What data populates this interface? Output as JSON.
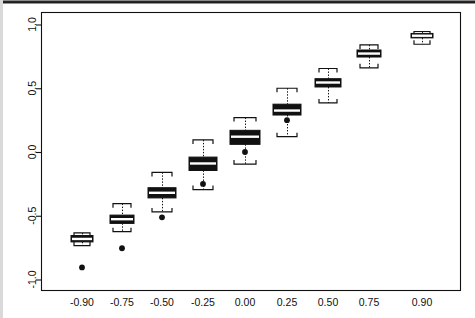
{
  "figure": {
    "kind": "boxplot-figure",
    "title": "",
    "background": "#ffffff",
    "ink_color": "#111111",
    "box_fill": "#111111",
    "median_color": "#ffffff"
  },
  "axes": {
    "x": {
      "label": "",
      "tick_labels": [
        "-0.90",
        "-0.75",
        "-0.50",
        "-0.25",
        "0.00",
        "0.25",
        "0.50",
        "0.75",
        "0.90"
      ]
    },
    "y": {
      "label": "",
      "tick_labels": [
        "-1.0",
        "-0.5",
        "0.0",
        "0.5",
        "1.0"
      ],
      "tick_values": [
        -1.0,
        -0.5,
        0.0,
        0.5,
        1.0
      ],
      "rotated_labels": true
    }
  },
  "chart_data": {
    "type": "box",
    "title": "",
    "xlabel": "",
    "ylabel": "",
    "xlim": [
      -1.0,
      1.0
    ],
    "ylim": [
      -1.08,
      1.08
    ],
    "grid": false,
    "legend": "none",
    "categories": [
      "-0.90",
      "-0.75",
      "-0.50",
      "-0.25",
      "0.00",
      "0.25",
      "0.50",
      "0.75",
      "0.90"
    ],
    "boxes": [
      {
        "category": "-0.90",
        "whisker_low": -0.735,
        "q1": -0.705,
        "median": -0.682,
        "q3": -0.655,
        "whisker_high": -0.635,
        "outliers": [
          -0.905
        ]
      },
      {
        "category": "-0.75",
        "whisker_low": -0.625,
        "q1": -0.56,
        "median": -0.527,
        "q3": -0.495,
        "whisker_high": -0.405,
        "outliers": [
          -0.755
        ]
      },
      {
        "category": "-0.50",
        "whisker_low": -0.47,
        "q1": -0.36,
        "median": -0.32,
        "q3": -0.28,
        "whisker_high": -0.16,
        "outliers": [
          -0.512
        ]
      },
      {
        "category": "-0.25",
        "whisker_low": -0.295,
        "q1": -0.145,
        "median": -0.09,
        "q3": -0.04,
        "whisker_high": 0.095,
        "outliers": [
          -0.25
        ]
      },
      {
        "category": "0.00",
        "whisker_low": -0.095,
        "q1": 0.06,
        "median": 0.12,
        "q3": 0.17,
        "whisker_high": 0.27,
        "outliers": [
          0.0
        ]
      },
      {
        "category": "0.25",
        "whisker_low": 0.12,
        "q1": 0.29,
        "median": 0.325,
        "q3": 0.375,
        "whisker_high": 0.5,
        "outliers": [
          0.25
        ]
      },
      {
        "category": "0.50",
        "whisker_low": 0.385,
        "q1": 0.51,
        "median": 0.545,
        "q3": 0.575,
        "whisker_high": 0.655,
        "outliers": []
      },
      {
        "category": "0.75",
        "whisker_low": 0.66,
        "q1": 0.745,
        "median": 0.772,
        "q3": 0.8,
        "whisker_high": 0.84,
        "outliers": []
      },
      {
        "category": "0.90",
        "whisker_low": 0.845,
        "q1": 0.895,
        "median": 0.912,
        "q3": 0.93,
        "whisker_high": 0.945,
        "outliers": []
      }
    ]
  },
  "geometry": {
    "plot_left": 41,
    "plot_right": 460,
    "plot_top": 12,
    "plot_bottom": 290,
    "y_zero_px": 152,
    "y_unit_px": 127.5,
    "box_centers_px": [
      82,
      122,
      162,
      203,
      245,
      287,
      328,
      369,
      422
    ],
    "box_half_widths_px": [
      11,
      12,
      14,
      14,
      15,
      14,
      13,
      12,
      11
    ]
  }
}
